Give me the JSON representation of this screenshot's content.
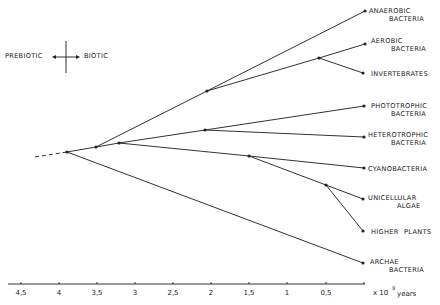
{
  "diagram": {
    "type": "phylogenetic-tree",
    "legend": {
      "left_label": "PREBIOTIC",
      "right_label": "BIOTIC"
    },
    "axis": {
      "ticks": [
        "4.5",
        "4",
        "3.5",
        "3",
        "2.5",
        "2",
        "1.5",
        "1",
        "0.5"
      ],
      "tick_display": [
        "4,5",
        "4",
        "3,5",
        "3",
        "2,5",
        "2",
        "1,5",
        "1",
        "0,5"
      ],
      "unit_prefix": "x 10",
      "unit_exponent": "9",
      "unit_suffix": "years"
    },
    "leaves": [
      {
        "line1": "ANAEROBIC",
        "line2": "BACTERIA"
      },
      {
        "line1": "AEROBIC",
        "line2": "BACTERIA"
      },
      {
        "line1": "INVERTEBRATES",
        "line2": ""
      },
      {
        "line1": "PHOTOTROPHIC",
        "line2": "BACTERIA"
      },
      {
        "line1": "HETEROTROPHIC",
        "line2": "BACTERIA"
      },
      {
        "line1": "CYANOBACTERIA",
        "line2": ""
      },
      {
        "line1": "UNICELLULAR",
        "line2": "ALGAE"
      },
      {
        "line1": "HIGHER",
        "line2": "PLANTS"
      },
      {
        "line1": "ARCHAE",
        "line2": "BACTERIA"
      }
    ]
  }
}
